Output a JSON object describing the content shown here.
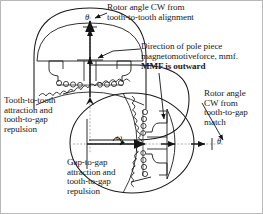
{
  "figure": {
    "background": "#ffffff",
    "stroke": "#1a1a1a"
  },
  "labels": {
    "top": "Rotor angle CW from\ntooth-to-tooth alignment",
    "mmf_line1": "Direction of pole piece\nmagnetomotiveforce, mmf.",
    "mmf_bold": "MMF is outward",
    "left": "Tooth-to-tooth\nattraction and\ntooth-to-gap\nrepulsion",
    "right": "Rotor angle\nCW from\ntooth-to-gap\nmatch",
    "bottom": "Gap-to-gap\nattraction and\ntooth-to-gap\nrepulsion"
  },
  "symbols": {
    "theta_top": "θ",
    "theta_right": "θ",
    "omega": "ω"
  },
  "diagrams": [
    {
      "name": "upper-machine-section",
      "orientation": "upright",
      "description": "Machine cross-section with dome rotor, pole piece and scalloped stator teeth; vertical MMF arrow outward"
    },
    {
      "name": "lower-machine-section",
      "orientation": "rotated-90-cw",
      "description": "Machine cross-section rotated 90 degrees clockwise with horizontal MMF arrow outward"
    }
  ]
}
